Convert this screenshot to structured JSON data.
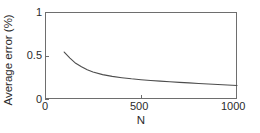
{
  "chart_data": {
    "type": "line",
    "title": "",
    "subtitle": "",
    "xlabel": "N",
    "ylabel": "Average error (%)",
    "xlim": [
      0,
      1000
    ],
    "ylim": [
      0,
      1
    ],
    "xticks": [
      0,
      500,
      1000
    ],
    "xtick_labels": [
      "0",
      "500",
      "1000"
    ],
    "yticks": [
      0,
      0.5,
      1
    ],
    "ytick_labels": [
      "0",
      "0.5",
      "1"
    ],
    "grid": false,
    "legend": null,
    "annotations": [],
    "series": [
      {
        "name": "Average error",
        "color": "#4d4d4d",
        "line_width": 1.1,
        "x": [
          100,
          130,
          160,
          190,
          220,
          250,
          300,
          350,
          400,
          450,
          500,
          550,
          600,
          650,
          700,
          750,
          800,
          850,
          900,
          950,
          1000
        ],
        "y": [
          0.54,
          0.47,
          0.41,
          0.37,
          0.335,
          0.31,
          0.28,
          0.26,
          0.245,
          0.232,
          0.222,
          0.213,
          0.205,
          0.198,
          0.191,
          0.185,
          0.179,
          0.173,
          0.167,
          0.161,
          0.155
        ]
      }
    ]
  },
  "axes": {
    "x_title": "N",
    "y_title": "Average error (%)",
    "x_tick_labels": [
      "0",
      "500",
      "1000"
    ],
    "y_tick_labels": [
      "0",
      "0.5",
      "1"
    ]
  },
  "style": {
    "axis_color": "#6e6e6e",
    "curve_color": "#4d4d4d",
    "text_color": "#2b2b2b",
    "background": "#ffffff"
  }
}
